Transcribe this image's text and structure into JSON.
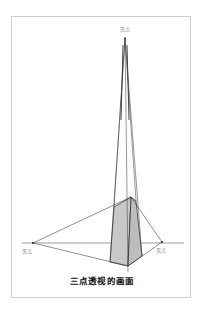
{
  "figure": {
    "caption": "三点透视的画面",
    "vanishing_points": [
      {
        "id": "top",
        "label": "灭点",
        "x": 125,
        "y": 38
      },
      {
        "id": "left",
        "label": "灭点",
        "x": 33,
        "y": 243
      },
      {
        "id": "right",
        "label": "灭点",
        "x": 162,
        "y": 242
      }
    ],
    "horizon": {
      "x1": 22,
      "x2": 184,
      "y": 243
    },
    "prism": {
      "top_left": [
        114,
        207
      ],
      "top_front": [
        131,
        197
      ],
      "top_right": [
        136,
        201
      ],
      "bottom_left": [
        110,
        262
      ],
      "bottom_front": [
        128,
        266
      ],
      "bottom_right": [
        142,
        256
      ]
    },
    "colors": {
      "line": "#222222",
      "face_fill": "#c8c8c8",
      "frame": "#cfcfcf"
    }
  }
}
